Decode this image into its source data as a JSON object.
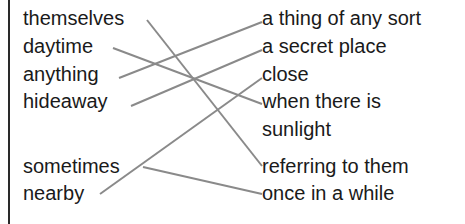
{
  "left_terms": [
    {
      "id": "themselves",
      "label": "themselves",
      "top": 6
    },
    {
      "id": "daytime",
      "label": "daytime",
      "top": 34
    },
    {
      "id": "anything",
      "label": "anything",
      "top": 62
    },
    {
      "id": "hideaway",
      "label": "hideaway",
      "top": 89
    },
    {
      "id": "sometimes",
      "label": "sometimes",
      "top": 154
    },
    {
      "id": "nearby",
      "label": "nearby",
      "top": 181
    }
  ],
  "right_definitions": [
    {
      "id": "thing",
      "label": "a thing of any sort",
      "top": 6
    },
    {
      "id": "secret",
      "label": "a secret place",
      "top": 34
    },
    {
      "id": "close",
      "label": "close",
      "top": 62
    },
    {
      "id": "when",
      "label": "when there is",
      "top": 89
    },
    {
      "id": "sunlight",
      "label": "sunlight",
      "top": 117
    },
    {
      "id": "referring",
      "label": "referring to them",
      "top": 154
    },
    {
      "id": "once",
      "label": "once in a while",
      "top": 181
    }
  ],
  "connections": [
    {
      "from": "themselves",
      "to": "referring to them",
      "x1": 147,
      "y1": 20,
      "x2": 262,
      "y2": 166
    },
    {
      "from": "daytime",
      "to": "when there is sunlight",
      "x1": 113,
      "y1": 48,
      "x2": 262,
      "y2": 104
    },
    {
      "from": "anything",
      "to": "a thing of any sort",
      "x1": 119,
      "y1": 78,
      "x2": 262,
      "y2": 22
    },
    {
      "from": "hideaway",
      "to": "a secret place",
      "x1": 131,
      "y1": 106,
      "x2": 262,
      "y2": 50
    },
    {
      "from": "sometimes",
      "to": "once in a while",
      "x1": 143,
      "y1": 167,
      "x2": 262,
      "y2": 194
    },
    {
      "from": "nearby",
      "to": "close",
      "x1": 100,
      "y1": 194,
      "x2": 262,
      "y2": 78
    }
  ],
  "line_color": "#8a8a8a"
}
